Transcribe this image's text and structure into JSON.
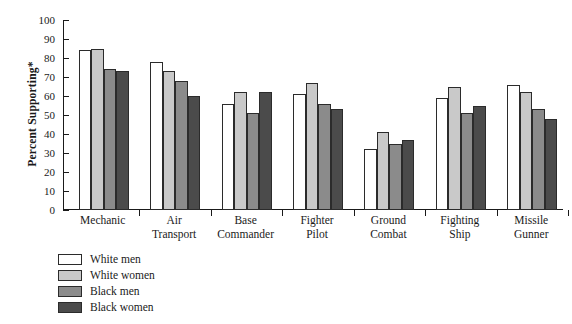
{
  "chart_data": {
    "type": "bar",
    "title": "",
    "xlabel": "",
    "ylabel": "Percent Supporting*",
    "ylim": [
      0,
      100
    ],
    "yticks": [
      0,
      10,
      20,
      30,
      40,
      50,
      60,
      70,
      80,
      90,
      100
    ],
    "grid": false,
    "legend_position": "below-left",
    "categories": [
      "Mechanic",
      "Air Transport",
      "Base Commander",
      "Fighter Pilot",
      "Ground Combat",
      "Fighting Ship",
      "Missile Gunner"
    ],
    "category_lines": [
      [
        "Mechanic",
        ""
      ],
      [
        "Air",
        "Transport"
      ],
      [
        "Base",
        "Commander"
      ],
      [
        "Fighter",
        "Pilot"
      ],
      [
        "Ground",
        "Combat"
      ],
      [
        "Fighting",
        "Ship"
      ],
      [
        "Missile",
        "Gunner"
      ]
    ],
    "series": [
      {
        "name": "White men",
        "color": "#ffffff",
        "values": [
          84,
          78,
          56,
          61,
          32,
          59,
          66
        ]
      },
      {
        "name": "White women",
        "color": "#c9c9c9",
        "values": [
          85,
          73,
          62,
          67,
          41,
          65,
          62
        ]
      },
      {
        "name": "Black men",
        "color": "#8b8b8b",
        "values": [
          74,
          68,
          51,
          56,
          35,
          51,
          53
        ]
      },
      {
        "name": "Black women",
        "color": "#4b4b4b",
        "values": [
          73,
          60,
          62,
          53,
          37,
          55,
          48
        ]
      }
    ]
  },
  "legend": {
    "items": [
      {
        "label": "White men",
        "color": "#ffffff"
      },
      {
        "label": "White women",
        "color": "#c9c9c9"
      },
      {
        "label": "Black men",
        "color": "#8b8b8b"
      },
      {
        "label": "Black women",
        "color": "#4b4b4b"
      }
    ]
  }
}
